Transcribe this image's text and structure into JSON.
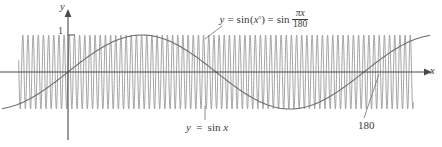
{
  "figure": {
    "background_color": "#ffffff",
    "width": 442,
    "height": 147
  },
  "axes": {
    "x_axis_label": "x",
    "y_axis_label": "y",
    "y_tick_label": "1",
    "origin_px": {
      "x": 68,
      "y": 72
    },
    "x_axis_color": "#4a4a4a",
    "y_axis_color": "#4a4a4a"
  },
  "labels": {
    "degree_formula": {
      "y": "y",
      "equals_1": "=",
      "sin_1": "sin",
      "open_paren": "(",
      "x_1": "x",
      "degree": "°",
      "close_paren": ")",
      "equals_2": "=",
      "sin_2": "sin",
      "numerator_pi": "π",
      "numerator_x": "x",
      "denominator": "180",
      "full_text": "y = sin(x°) = sin πx/180"
    },
    "sine_formula": {
      "y": "y",
      "equals": "=",
      "sin": "sin",
      "x": "x",
      "full_text": "y = sin x"
    },
    "one_eighty": "180"
  },
  "chart_data": {
    "type": "line",
    "title": "",
    "xlabel": "x",
    "ylabel": "y",
    "grid": false,
    "legend": "annotations",
    "xlim": [
      -60,
      420
    ],
    "ylim": [
      -1.35,
      1.35
    ],
    "x_axis_pixel_y": 72,
    "y_axis_pixel_x": 68,
    "pixels_per_x_unit": 0.8222,
    "pixels_per_y_unit": 37,
    "annotations": [
      {
        "text": "y = sin(x°) = sin πx/180",
        "target_x": 90,
        "target_y": 1.0,
        "position": "above-center"
      },
      {
        "text": "y = sin x",
        "target_x": 160,
        "target_y": -1.0,
        "position": "below-center"
      },
      {
        "text": "180",
        "target_x": 180,
        "target_y": 0,
        "position": "below-right"
      }
    ],
    "series": [
      {
        "name": "y = sin x",
        "expression": "sin(x)",
        "period_in_x_units": 6.2832,
        "amplitude": 1.0,
        "visible_cycles": 33,
        "color": "#9a9a9a",
        "line_width": 0.9,
        "x_range": [
          -60,
          420
        ],
        "samples_x": [
          -60,
          -48,
          -36,
          -24,
          -12,
          0,
          12,
          24,
          36,
          48,
          60,
          72,
          84,
          96,
          108,
          120,
          132,
          144,
          156,
          168,
          180,
          192,
          204,
          216,
          228,
          240,
          252,
          264,
          276,
          288,
          300,
          312,
          324,
          336,
          348,
          360,
          372,
          384,
          396,
          408,
          420
        ],
        "samples_y": [
          0.305,
          -0.768,
          0.992,
          0.906,
          0.537,
          0.0,
          -0.537,
          -0.906,
          -0.992,
          -0.768,
          -0.305,
          0.254,
          0.733,
          0.984,
          0.927,
          0.581,
          0.058,
          -0.492,
          -0.884,
          -0.997,
          -0.801,
          -0.355,
          0.203,
          0.696,
          0.974,
          0.945,
          0.623,
          0.116,
          -0.446,
          -0.861,
          -0.999,
          -0.831,
          -0.404,
          0.152,
          0.657,
          0.959,
          0.961,
          0.663,
          0.163,
          -0.398,
          -0.828
        ]
      },
      {
        "name": "y = sin(x°) = sin πx/180",
        "expression": "sin(pi*x/180)",
        "period_in_x_units": 360,
        "amplitude": 1.0,
        "color": "#6e6e6e",
        "line_width": 1.1,
        "x_range": [
          -80,
          440
        ],
        "samples_x": [
          -80,
          -60,
          -40,
          -20,
          0,
          20,
          40,
          60,
          80,
          90,
          100,
          120,
          140,
          160,
          180,
          200,
          220,
          240,
          260,
          280,
          300,
          320,
          340,
          360,
          380,
          400,
          420,
          440
        ],
        "samples_y": [
          -0.985,
          -0.866,
          -0.643,
          -0.342,
          0.0,
          0.342,
          0.643,
          0.866,
          0.985,
          1.0,
          0.985,
          0.866,
          0.643,
          0.342,
          0.0,
          -0.342,
          -0.643,
          -0.866,
          -0.985,
          -0.985,
          -0.866,
          -0.643,
          -0.342,
          0.0,
          0.342,
          0.643,
          0.866,
          0.985
        ]
      }
    ],
    "x_axis_crossing_marked": 180
  }
}
